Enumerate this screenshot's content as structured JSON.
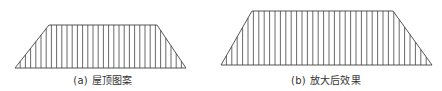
{
  "figure": {
    "stroke_color": "#444444",
    "panels": [
      {
        "id": "a",
        "caption": "(a) 屋顶图案",
        "caption_x": 103,
        "shape": {
          "type": "trapezoid",
          "base_left": 15,
          "base_right": 186,
          "base_y": 68,
          "top_left": 49,
          "top_right": 157,
          "top_y": 25
        },
        "hatch": {
          "direction": "vertical",
          "spacing": 5.2
        }
      },
      {
        "id": "b",
        "caption": "(b) 放大后效果",
        "caption_x": 326,
        "shape": {
          "type": "trapezoid",
          "base_left": 221,
          "base_right": 432,
          "base_y": 65,
          "top_left": 252,
          "top_right": 393,
          "top_y": 11
        },
        "hatch": {
          "direction": "vertical",
          "spacing": 5.4
        }
      }
    ]
  }
}
